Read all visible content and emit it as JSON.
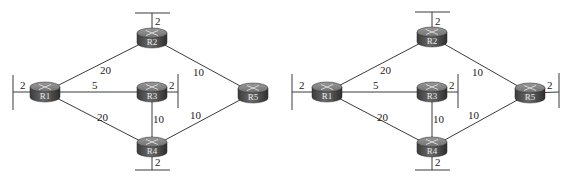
{
  "diagrams": [
    {
      "name": "topology-left",
      "routers": [
        {
          "id": "R1",
          "label": "R1",
          "cx": 45,
          "cy": 92
        },
        {
          "id": "R2",
          "label": "R2",
          "cx": 152,
          "cy": 38
        },
        {
          "id": "R3",
          "label": "R3",
          "cx": 152,
          "cy": 92
        },
        {
          "id": "R4",
          "label": "R4",
          "cx": 152,
          "cy": 147
        },
        {
          "id": "R5",
          "label": "R5",
          "cx": 253,
          "cy": 93
        }
      ],
      "links": [
        {
          "from": "R1",
          "to": "R2",
          "cost": "20",
          "lx": 100,
          "ly": 74
        },
        {
          "from": "R1",
          "to": "R3",
          "cost": "5",
          "lx": 92,
          "ly": 89
        },
        {
          "from": "R1",
          "to": "R4",
          "cost": "20",
          "lx": 97,
          "ly": 121
        },
        {
          "from": "R2",
          "to": "R5",
          "cost": "10",
          "lx": 193,
          "ly": 76
        },
        {
          "from": "R3",
          "to": "R4",
          "cost": "10",
          "lx": 153,
          "ly": 123
        },
        {
          "from": "R4",
          "to": "R5",
          "cost": "10",
          "lx": 190,
          "ly": 119
        }
      ],
      "stubs": [
        {
          "router": "R1",
          "cost": "2",
          "x1": 13,
          "y1": 92,
          "bar": [
            13,
            75,
            13,
            110
          ],
          "lx": 20,
          "ly": 89
        },
        {
          "router": "R2",
          "cost": "2",
          "x1": 152,
          "y1": 13,
          "bar": [
            135,
            13,
            170,
            13
          ],
          "lx": 155,
          "ly": 25
        },
        {
          "router": "R3",
          "cost": "2",
          "x1": 178,
          "y1": 92,
          "bar": [
            178,
            74,
            178,
            108
          ],
          "lx": 169,
          "ly": 89
        },
        {
          "router": "R4",
          "cost": "2",
          "x1": 152,
          "y1": 170,
          "bar": [
            135,
            170,
            170,
            170
          ],
          "lx": 155,
          "ly": 166
        }
      ]
    },
    {
      "name": "topology-right",
      "routers": [
        {
          "id": "R1",
          "label": "R1",
          "cx": 327,
          "cy": 92
        },
        {
          "id": "R2",
          "label": "R2",
          "cx": 432,
          "cy": 37
        },
        {
          "id": "R3",
          "label": "R3",
          "cx": 432,
          "cy": 92
        },
        {
          "id": "R4",
          "label": "R4",
          "cx": 432,
          "cy": 147
        },
        {
          "id": "R5",
          "label": "R5",
          "cx": 530,
          "cy": 93
        }
      ],
      "links": [
        {
          "from": "R1",
          "to": "R2",
          "cost": "20",
          "lx": 380,
          "ly": 74
        },
        {
          "from": "R1",
          "to": "R3",
          "cost": "5",
          "lx": 373,
          "ly": 89
        },
        {
          "from": "R1",
          "to": "R4",
          "cost": "20",
          "lx": 377,
          "ly": 121
        },
        {
          "from": "R2",
          "to": "R5",
          "cost": "10",
          "lx": 472,
          "ly": 76
        },
        {
          "from": "R3",
          "to": "R4",
          "cost": "10",
          "lx": 433,
          "ly": 123
        },
        {
          "from": "R4",
          "to": "R5",
          "cost": "10",
          "lx": 468,
          "ly": 119
        }
      ],
      "stubs": [
        {
          "router": "R1",
          "cost": "2",
          "x1": 292,
          "y1": 92,
          "bar": [
            292,
            74,
            292,
            110
          ],
          "lx": 299,
          "ly": 89
        },
        {
          "router": "R2",
          "cost": "2",
          "x1": 432,
          "y1": 12,
          "bar": [
            415,
            12,
            450,
            12
          ],
          "lx": 435,
          "ly": 25
        },
        {
          "router": "R3",
          "cost": "2",
          "x1": 458,
          "y1": 92,
          "bar": [
            458,
            74,
            458,
            108
          ],
          "lx": 449,
          "ly": 89
        },
        {
          "router": "R4",
          "cost": "2",
          "x1": 432,
          "y1": 170,
          "bar": [
            415,
            170,
            450,
            170
          ],
          "lx": 435,
          "ly": 166
        },
        {
          "router": "R5",
          "cost": "2",
          "x1": 559,
          "y1": 92,
          "bar": [
            559,
            73,
            559,
            108
          ],
          "lx": 547,
          "ly": 89
        }
      ]
    }
  ],
  "style": {
    "router_top": "#8a8a8a",
    "router_side": "#4a4a4a",
    "line": "#3a3a3a"
  }
}
